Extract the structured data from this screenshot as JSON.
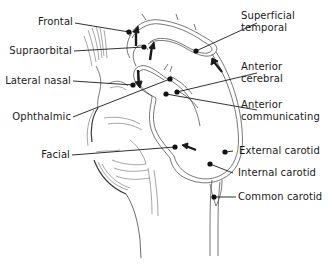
{
  "diagram": {
    "type": "anatomical-illustration",
    "colors": {
      "background": "#ffffff",
      "ink": "#1a1a1a",
      "vessel_outline": "#555555",
      "shading": "#6a6a6a"
    },
    "labels_left": [
      {
        "id": "frontal",
        "text": "Frontal"
      },
      {
        "id": "supraorbital",
        "text": "Supraorbital"
      },
      {
        "id": "lateral-nasal",
        "text": "Lateral nasal"
      },
      {
        "id": "ophthalmic",
        "text": "Ophthalmic"
      },
      {
        "id": "facial",
        "text": "Facial"
      }
    ],
    "labels_right": [
      {
        "id": "superficial-temporal",
        "line1": "Superficial",
        "line2": "temporal"
      },
      {
        "id": "anterior-cerebral",
        "line1": "Anterior",
        "line2": "cerebral"
      },
      {
        "id": "anterior-communicating",
        "line1": "Anterior",
        "line2": "communicating"
      },
      {
        "id": "external-carotid",
        "line1": "External carotid"
      },
      {
        "id": "internal-carotid",
        "line1": "Internal carotid"
      },
      {
        "id": "common-carotid",
        "line1": "Common carotid"
      }
    ],
    "flow_arrows": 6
  }
}
